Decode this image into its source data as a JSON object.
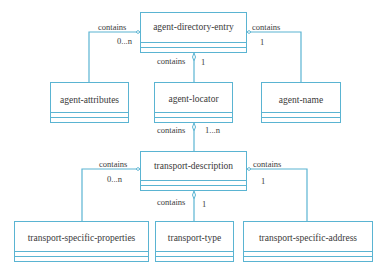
{
  "diagram": {
    "type": "UML class diagram",
    "line_color": "#5ab4d2",
    "classes": [
      {
        "id": "ade",
        "name": "agent-directory-entry"
      },
      {
        "id": "aa",
        "name": "agent-attributes"
      },
      {
        "id": "al",
        "name": "agent-locator"
      },
      {
        "id": "an",
        "name": "agent-name"
      },
      {
        "id": "td",
        "name": "transport-description"
      },
      {
        "id": "tsp",
        "name": "transport-specific-properties"
      },
      {
        "id": "tt",
        "name": "transport-type"
      },
      {
        "id": "tsa",
        "name": "transport-specific-address"
      }
    ],
    "relations": [
      {
        "from": "agent-directory-entry",
        "to": "agent-attributes",
        "label": "contains",
        "multiplicity": "0...n"
      },
      {
        "from": "agent-directory-entry",
        "to": "agent-locator",
        "label": "contains",
        "multiplicity": "1"
      },
      {
        "from": "agent-directory-entry",
        "to": "agent-name",
        "label": "contains",
        "multiplicity": "1"
      },
      {
        "from": "agent-locator",
        "to": "transport-description",
        "label": "contains",
        "multiplicity": "1...n"
      },
      {
        "from": "transport-description",
        "to": "transport-specific-properties",
        "label": "contains",
        "multiplicity": "0...n"
      },
      {
        "from": "transport-description",
        "to": "transport-type",
        "label": "contains",
        "multiplicity": "1"
      },
      {
        "from": "transport-description",
        "to": "transport-specific-address",
        "label": "contains",
        "multiplicity": "1"
      }
    ]
  }
}
